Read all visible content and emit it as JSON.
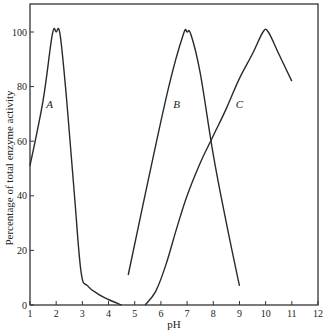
{
  "chart_data": {
    "type": "line",
    "title": "",
    "xlabel": "pH",
    "ylabel": "Percentage of total enzyme activity",
    "xlim": [
      1,
      12
    ],
    "ylim": [
      0,
      110
    ],
    "xticks": [
      1,
      2,
      3,
      4,
      5,
      6,
      7,
      8,
      9,
      10,
      11,
      12
    ],
    "yticks": [
      0,
      20,
      40,
      60,
      80,
      100
    ],
    "grid": false,
    "legend": "none (curves labeled inline)",
    "series": [
      {
        "name": "A",
        "label_pos": {
          "x": 1.75,
          "y": 72
        },
        "points": [
          [
            1,
            51
          ],
          [
            1.5,
            75
          ],
          [
            1.85,
            99
          ],
          [
            2.0,
            100
          ],
          [
            2.15,
            99
          ],
          [
            2.4,
            75
          ],
          [
            2.7,
            40
          ],
          [
            2.95,
            12
          ],
          [
            3.2,
            7
          ],
          [
            3.6,
            4
          ],
          [
            4.0,
            2
          ],
          [
            4.5,
            0
          ]
        ]
      },
      {
        "name": "B",
        "label_pos": {
          "x": 6.6,
          "y": 72
        },
        "points": [
          [
            4.75,
            11
          ],
          [
            5.5,
            45
          ],
          [
            6.3,
            80
          ],
          [
            6.85,
            99
          ],
          [
            7.0,
            100
          ],
          [
            7.15,
            99
          ],
          [
            7.5,
            85
          ],
          [
            8.0,
            55
          ],
          [
            8.5,
            30
          ],
          [
            9.0,
            7
          ]
        ]
      },
      {
        "name": "C",
        "label_pos": {
          "x": 9.0,
          "y": 72
        },
        "points": [
          [
            5.4,
            0
          ],
          [
            5.8,
            5
          ],
          [
            6.2,
            15
          ],
          [
            6.6,
            28
          ],
          [
            7.0,
            40
          ],
          [
            7.5,
            52
          ],
          [
            8.0,
            62
          ],
          [
            8.5,
            72
          ],
          [
            9.0,
            83
          ],
          [
            9.5,
            92
          ],
          [
            9.9,
            100
          ],
          [
            10.1,
            100
          ],
          [
            10.5,
            92
          ],
          [
            11.0,
            82
          ]
        ]
      }
    ]
  },
  "labels": {
    "x_axis_title": "pH",
    "y_axis_title": "Percentage of total enzyme activity",
    "x_tick_labels": [
      "1",
      "2",
      "3",
      "4",
      "5",
      "6",
      "7",
      "8",
      "9",
      "10",
      "11",
      "12"
    ],
    "y_tick_labels": [
      "0",
      "20",
      "40",
      "60",
      "80",
      "100"
    ],
    "curve_A": "A",
    "curve_B": "B",
    "curve_C": "C"
  },
  "colors": {
    "line": "#2a2a2a",
    "axis": "#333333",
    "background": "#ffffff"
  }
}
